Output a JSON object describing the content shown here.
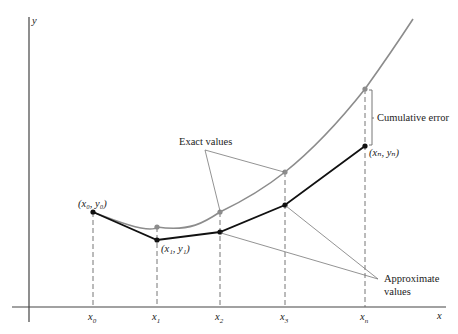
{
  "diagram": {
    "axes": {
      "x_label": "x",
      "y_label": "y"
    },
    "ticks": [
      {
        "label": "x",
        "sub": "0",
        "x": 93
      },
      {
        "label": "x",
        "sub": "1",
        "x": 157
      },
      {
        "label": "x",
        "sub": "2",
        "x": 220
      },
      {
        "label": "x",
        "sub": "3",
        "x": 285
      },
      {
        "label": "x",
        "sub": "n",
        "x": 365
      }
    ],
    "point_labels": {
      "p0": "(x₀, y₀)",
      "p1": "(x₁, y₁)",
      "pn": "(xₙ, yₙ)"
    },
    "annotations": {
      "exact": "Exact values",
      "approx_line1": "Approximate",
      "approx_line2": "values",
      "error": "Cumulative error"
    },
    "exact_points": [
      [
        157,
        227
      ],
      [
        220,
        212
      ],
      [
        285,
        172
      ],
      [
        365,
        89
      ]
    ],
    "approx_points": [
      [
        93,
        212
      ],
      [
        157,
        240
      ],
      [
        220,
        232
      ],
      [
        285,
        205
      ],
      [
        365,
        146
      ]
    ],
    "colors": {
      "exact_curve": "#8c8c8c",
      "approx_curve": "#111111",
      "axes": "#333333",
      "guides": "#666666"
    }
  }
}
